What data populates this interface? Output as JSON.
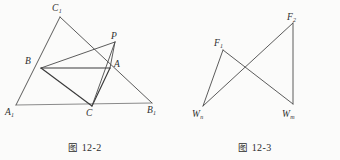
{
  "page": {
    "background_color": "#fbfbfa",
    "stroke_color": "#4a4a4a",
    "label_color": "#2e2e2e"
  },
  "figures": [
    {
      "id": "figure-12-2",
      "caption_cjk": "图",
      "caption_number": "12-2",
      "caption_full": "图 12-2",
      "labels": [
        {
          "name": "label-C1",
          "base": "C",
          "sub": "1",
          "text": "C₁",
          "x": 52,
          "y": 4
        },
        {
          "name": "label-P",
          "base": "P",
          "sub": "",
          "text": "P",
          "x": 111,
          "y": 32
        },
        {
          "name": "label-B",
          "base": "B",
          "sub": "",
          "text": "B",
          "x": 25,
          "y": 57
        },
        {
          "name": "label-A",
          "base": "A",
          "sub": "",
          "text": "A",
          "x": 114,
          "y": 60
        },
        {
          "name": "label-A1",
          "base": "A",
          "sub": "1",
          "text": "A₁",
          "x": 5,
          "y": 108
        },
        {
          "name": "label-C",
          "base": "C",
          "sub": "",
          "text": "C",
          "x": 86,
          "y": 109
        },
        {
          "name": "label-B1",
          "base": "B",
          "sub": "1",
          "text": "B₁",
          "x": 147,
          "y": 106
        }
      ],
      "points": {
        "A1": [
          16,
          105
        ],
        "B1": [
          152,
          103
        ],
        "C1": [
          60,
          17
        ],
        "A": [
          110,
          68
        ],
        "B": [
          41,
          68
        ],
        "C": [
          92,
          106
        ],
        "P": [
          115,
          42
        ]
      },
      "segments": [
        {
          "name": "segment-A1-B1",
          "from": "A1",
          "to": "B1",
          "weight": "light"
        },
        {
          "name": "segment-A1-C1",
          "from": "A1",
          "to": "C1",
          "weight": "normal"
        },
        {
          "name": "segment-C1-B1",
          "from": "C1",
          "to": "B1",
          "weight": "normal"
        },
        {
          "name": "segment-A-B",
          "from": "A",
          "to": "B",
          "weight": "heavy"
        },
        {
          "name": "segment-B-C",
          "from": "B",
          "to": "C",
          "weight": "heavy"
        },
        {
          "name": "segment-C-A",
          "from": "C",
          "to": "A",
          "weight": "heavy"
        },
        {
          "name": "segment-B-P",
          "from": "B",
          "to": "P",
          "weight": "normal"
        },
        {
          "name": "segment-P-A",
          "from": "P",
          "to": "A",
          "weight": "normal"
        },
        {
          "name": "segment-P-C",
          "from": "P",
          "to": "C",
          "weight": "normal"
        }
      ]
    },
    {
      "id": "figure-12-3",
      "caption_cjk": "图",
      "caption_number": "12-3",
      "caption_full": "图 12-3",
      "labels": [
        {
          "name": "label-F2",
          "base": "F",
          "sub": "2",
          "text": "F₂",
          "x": 117,
          "y": 13
        },
        {
          "name": "label-F1",
          "base": "F",
          "sub": "1",
          "text": "F₁",
          "x": 44,
          "y": 39
        },
        {
          "name": "label-Wn",
          "base": "W",
          "sub": "n",
          "text": "Wₙ",
          "x": 22,
          "y": 110
        },
        {
          "name": "label-Wm",
          "base": "W",
          "sub": "m",
          "text": "Wₘ",
          "x": 112,
          "y": 110
        }
      ],
      "points": {
        "F1": [
          53,
          50
        ],
        "F2": [
          123,
          23
        ],
        "Wn": [
          33,
          106
        ],
        "Wm": [
          123,
          104
        ]
      },
      "segments": [
        {
          "name": "segment-F1-Wn",
          "from": "F1",
          "to": "Wn",
          "weight": "normal"
        },
        {
          "name": "segment-F1-Wm",
          "from": "F1",
          "to": "Wm",
          "weight": "normal"
        },
        {
          "name": "segment-F2-Wm",
          "from": "F2",
          "to": "Wm",
          "weight": "normal"
        },
        {
          "name": "segment-F2-Wn",
          "from": "F2",
          "to": "Wn",
          "weight": "normal"
        }
      ]
    }
  ]
}
